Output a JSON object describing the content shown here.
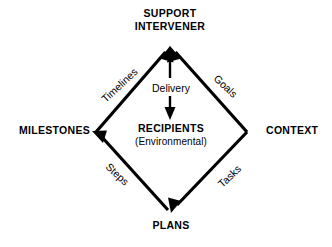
{
  "diagram": {
    "type": "diamond-cycle-diagram",
    "background_color": "#ffffff",
    "line_color": "#000000",
    "text_color": "#000000",
    "nodes": [
      {
        "id": "support-intervener",
        "position": "top",
        "line1": "SUPPORT",
        "line2": "INTERVENER",
        "style": "bold-caps"
      },
      {
        "id": "milestones",
        "position": "left",
        "line1": "MILESTONES",
        "style": "bold-caps"
      },
      {
        "id": "context",
        "position": "right",
        "line1": "CONTEXT",
        "style": "bold-caps"
      },
      {
        "id": "plans",
        "position": "bottom",
        "line1": "PLANS",
        "style": "bold-caps"
      },
      {
        "id": "recipients",
        "position": "center",
        "line1": "RECIPIENTS",
        "line2": "(Environmental)",
        "style": "bold-caps-with-subtitle"
      }
    ],
    "edges": [
      {
        "id": "edge-timelines",
        "label": "Timelines",
        "from": "milestones",
        "to": "support-intervener",
        "side": "upper-left",
        "arrowhead": "at-support-intervener"
      },
      {
        "id": "edge-goals",
        "label": "Goals",
        "from": "context",
        "to": "support-intervener",
        "side": "upper-right",
        "arrowhead": "at-support-intervener"
      },
      {
        "id": "edge-steps",
        "label": "Steps",
        "from": "plans",
        "to": "milestones",
        "side": "lower-left",
        "arrowhead": "at-milestones"
      },
      {
        "id": "edge-tasks",
        "label": "Tasks",
        "from": "context",
        "to": "plans",
        "side": "lower-right",
        "arrowhead": "at-plans"
      },
      {
        "id": "edge-delivery",
        "label": "Delivery",
        "from": "support-intervener",
        "to": "recipients",
        "side": "center-vertical",
        "arrowhead": "at-recipients"
      }
    ]
  }
}
